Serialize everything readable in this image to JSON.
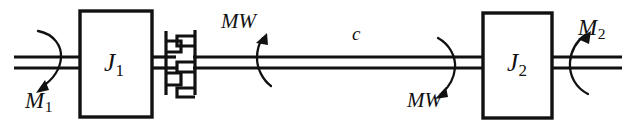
{
  "figure": {
    "type": "mechanical-schematic",
    "background_color": "#ffffff",
    "line_color": "#111111",
    "width": 636,
    "height": 127
  },
  "blocks": [
    {
      "id": "inertia-1",
      "label": "J",
      "subscript": "1",
      "name": "rotational inertia J1",
      "x": 80,
      "y": 11,
      "width": 72,
      "height": 106
    },
    {
      "id": "inertia-2",
      "label": "J",
      "subscript": "2",
      "name": "rotational inertia J2",
      "x": 483,
      "y": 13,
      "width": 69,
      "height": 105
    }
  ],
  "torques": [
    {
      "id": "torque-input",
      "label": "M",
      "subscript": "1",
      "name": "input torque M1",
      "arrow_direction": "counterclockwise-down-left"
    },
    {
      "id": "torque-output",
      "label": "M",
      "subscript": "2",
      "name": "output torque M2",
      "arrow_direction": "counterclockwise-up-left"
    },
    {
      "id": "shaft-torque-upper",
      "label": "MW",
      "subscript": "",
      "name": "shaft reaction torque MW upper",
      "arrow_direction": "up-left"
    },
    {
      "id": "shaft-torque-lower",
      "label": "MW",
      "subscript": "",
      "name": "shaft reaction torque MW lower",
      "arrow_direction": "down-left"
    }
  ],
  "shaft": {
    "label": "c",
    "name": "connecting shaft stiffness c",
    "upper_line_y": 57,
    "lower_line_y": 68,
    "left_end_x": 14,
    "right_end_x": 622
  },
  "coupling": {
    "name": "claw-clutch-coupling",
    "center_x": 180,
    "teeth": 2
  }
}
